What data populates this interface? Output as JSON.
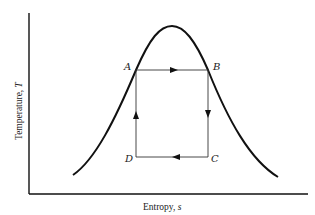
{
  "diagram": {
    "type": "T-s diagram (Carnot cycle inside saturation dome)",
    "x_axis": {
      "label_main": "Entropy, ",
      "label_var": "s"
    },
    "y_axis": {
      "label_main": "Temperature, ",
      "label_var": "T"
    },
    "points": {
      "A": {
        "label": "A",
        "position": "top-left, on dome left side"
      },
      "B": {
        "label": "B",
        "position": "top-right, on dome right side"
      },
      "C": {
        "label": "C",
        "position": "bottom-right"
      },
      "D": {
        "label": "D",
        "position": "bottom-left"
      }
    },
    "cycle_paths": [
      {
        "from": "A",
        "to": "B",
        "direction": "right"
      },
      {
        "from": "B",
        "to": "C",
        "direction": "down"
      },
      {
        "from": "C",
        "to": "D",
        "direction": "left"
      },
      {
        "from": "D",
        "to": "A",
        "direction": "up"
      }
    ],
    "colors": {
      "line": "#111111",
      "background": "#ffffff"
    }
  }
}
